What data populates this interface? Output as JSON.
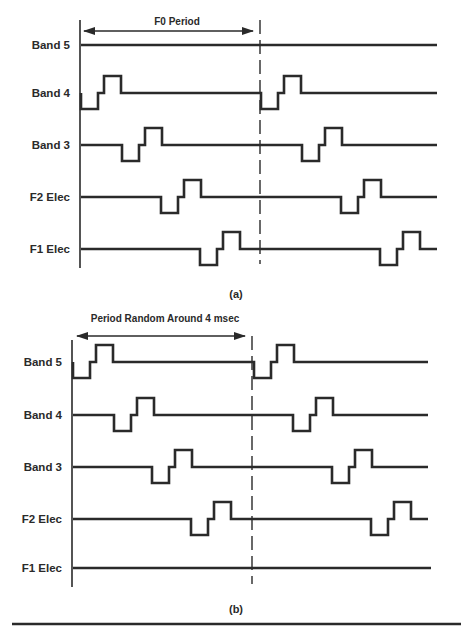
{
  "colors": {
    "ink": "#2a2a2a",
    "background": "#ffffff"
  },
  "panels": [
    {
      "id": "a",
      "caption": "(a)",
      "period_label": "F0 Period",
      "axis": {
        "x": 80,
        "y_top": 20,
        "y_bottom": 268
      },
      "marker_x": 260,
      "marker_y": [
        20,
        264
      ],
      "arrow": {
        "y": 31,
        "x1": 84,
        "x2": 253
      },
      "period_label_pos": {
        "x": 177,
        "y": 25
      },
      "caption_pos": {
        "x": 236,
        "y": 298
      },
      "label_right_x": 70,
      "traces": [
        {
          "label": "Band 5",
          "baseline": 45,
          "end_x": 437,
          "pulses": []
        },
        {
          "label": "Band 4",
          "baseline": 93,
          "end_x": 437,
          "pulses": [
            81,
            261
          ]
        },
        {
          "label": "Band 3",
          "baseline": 145,
          "end_x": 437,
          "pulses": [
            122,
            302
          ]
        },
        {
          "label": "F2 Elec",
          "baseline": 197,
          "end_x": 437,
          "pulses": [
            161,
            341
          ]
        },
        {
          "label": "F1 Elec",
          "baseline": 249,
          "end_x": 437,
          "pulses": [
            200,
            380
          ]
        }
      ]
    },
    {
      "id": "b",
      "caption": "(b)",
      "period_label": "Period Random Around 4 msec",
      "axis": {
        "x": 72,
        "y_top": 340,
        "y_bottom": 587
      },
      "marker_x": 252,
      "marker_y": [
        336,
        584
      ],
      "arrow": {
        "y": 336,
        "x1": 77,
        "x2": 245
      },
      "period_label_pos": {
        "x": 165,
        "y": 322
      },
      "caption_pos": {
        "x": 236,
        "y": 613
      },
      "label_right_x": 62,
      "traces": [
        {
          "label": "Band 5",
          "baseline": 362,
          "end_x": 428,
          "pulses": [
            73,
            254
          ]
        },
        {
          "label": "Band 4",
          "baseline": 415,
          "end_x": 428,
          "pulses": [
            114,
            293
          ]
        },
        {
          "label": "Band 3",
          "baseline": 467,
          "end_x": 428,
          "pulses": [
            152,
            332
          ]
        },
        {
          "label": "F2 Elec",
          "baseline": 519,
          "end_x": 428,
          "pulses": [
            191,
            371
          ]
        },
        {
          "label": "F1 Elec",
          "baseline": 568,
          "end_x": 431,
          "pulses": []
        }
      ]
    }
  ],
  "pulse_shape": {
    "description": "biphasic step pulse: drop below baseline, return to baseline step, rise above baseline, return",
    "low_width": 17,
    "step_width": 6,
    "high_width": 17,
    "low_depth": 16,
    "high_height": 17
  },
  "bottom_rule": {
    "y": 624,
    "x1": 12,
    "x2": 461
  }
}
